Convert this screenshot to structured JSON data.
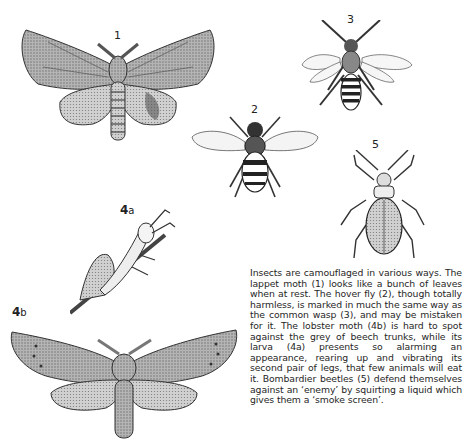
{
  "figures": [
    {
      "id": "1",
      "label": "1",
      "name": "Lappet moth"
    },
    {
      "id": "2",
      "label": "2",
      "name": "Hover fly"
    },
    {
      "id": "3",
      "label": "3",
      "name": "Common wasp"
    },
    {
      "id": "4a",
      "label_main": "4",
      "label_sub": "a",
      "name": "Lobster moth larva"
    },
    {
      "id": "4b",
      "label_main": "4",
      "label_sub": "b",
      "name": "Lobster moth"
    },
    {
      "id": "5",
      "label": "5",
      "name": "Bombardier beetle"
    }
  ],
  "caption": {
    "text": "Insects are camouflaged in various ways. The lappet moth (1) looks like a bunch of leaves when at rest. The hover fly (2), though totally harmless, is marked in much the same way as the common wasp (3), and may be mistaken for it. The lobster moth (4b) is hard to spot against the grey of beech trunks, while its larva (4a) presents so alarming an appearance, rearing up and vibrating its second pair of legs, that few animals will eat it. Bombardier beetles (5) defend themselves against an ‘enemy’ by squirting a liquid which gives them a ‘smoke screen’."
  },
  "colors": {
    "ink": "#1e1e1e",
    "paper": "#ffffff",
    "wing_shade": "#9a9a9a",
    "wing_light": "#c8c8c8"
  }
}
